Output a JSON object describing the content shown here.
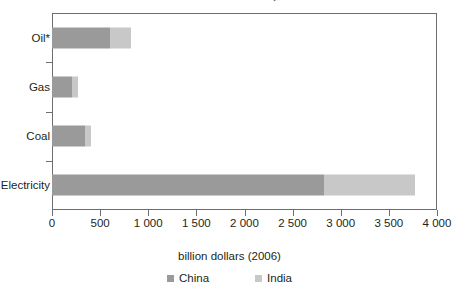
{
  "chart_data": {
    "type": "bar",
    "orientation": "horizontal",
    "stacked": true,
    "title": "Table 1. Estimated subsidies, 2006-08",
    "categories": [
      "Oil*",
      "Gas",
      "Coal",
      "Electricity"
    ],
    "series": [
      {
        "name": "China",
        "color": "#9a9a9a",
        "values": [
          600,
          210,
          340,
          2830
        ]
      },
      {
        "name": "India",
        "color": "#c8c8c8",
        "values": [
          220,
          60,
          70,
          940
        ]
      }
    ],
    "xlabel": "billion dollars (2006)",
    "ylabel": "",
    "xlim": [
      0,
      4000
    ],
    "xticks": [
      0,
      500,
      1000,
      1500,
      2000,
      2500,
      3000,
      3500,
      4000
    ],
    "xtick_labels": [
      "0",
      "500",
      "1 000",
      "1 500",
      "2 000",
      "2 500",
      "3 000",
      "3 500",
      "4 000"
    ],
    "grid": false,
    "legend_position": "bottom"
  }
}
